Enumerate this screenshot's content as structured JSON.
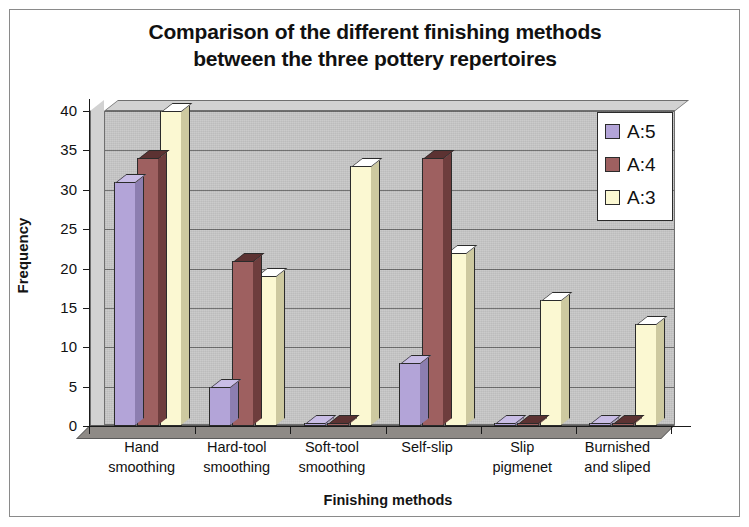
{
  "chart_data": {
    "type": "bar",
    "title": "Comparison of the different finishing methods between the three pottery repertoires",
    "title_lines": [
      "Comparison of the different finishing methods",
      "between the three pottery repertoires"
    ],
    "xlabel": "Finishing methods",
    "ylabel": "Frequency",
    "ylim": [
      0,
      40
    ],
    "yticks": [
      0,
      5,
      10,
      15,
      20,
      25,
      30,
      35,
      40
    ],
    "ytick_labels": [
      "0",
      "5",
      "10",
      "15",
      "20",
      "25",
      "30",
      "35",
      "40"
    ],
    "grid": true,
    "legend_position": "upper right",
    "categories": [
      "Hand smoothing",
      "Hard-tool smoothing",
      "Soft-tool smoothing",
      "Self-slip",
      "Slip pigmenet",
      "Burnished and sliped"
    ],
    "category_lines": [
      [
        "Hand",
        "smoothing"
      ],
      [
        "Hard-tool",
        "smoothing"
      ],
      [
        "Soft-tool",
        "smoothing"
      ],
      [
        "Self-slip",
        ""
      ],
      [
        "Slip",
        "pigmenet"
      ],
      [
        "Burnished",
        "and sliped"
      ]
    ],
    "series": [
      {
        "name": "A:5",
        "color": "#b3a4d8",
        "side_color": "#8c7eb0",
        "cap_color": "#c9bde6",
        "values": [
          31,
          5,
          0,
          8,
          0,
          0
        ]
      },
      {
        "name": "A:4",
        "color": "#9e6060",
        "side_color": "#6e3d3d",
        "cap_color": "#5c3232",
        "values": [
          34,
          21,
          0,
          34,
          0,
          0
        ]
      },
      {
        "name": "A:3",
        "color": "#fbf8d2",
        "side_color": "#cdc9a0",
        "cap_color": "#ffffff",
        "values": [
          40,
          19,
          33,
          22,
          16,
          13
        ]
      }
    ]
  },
  "legend": {
    "entries": [
      {
        "label": "A:5"
      },
      {
        "label": "A:4"
      },
      {
        "label": "A:3"
      }
    ]
  },
  "colors": {
    "plot_background": "#c9c9c9",
    "wall": "#d2d2d2",
    "floor": "#8e8a86",
    "gridline": "#6d6d6d",
    "axis": "#1a1a1a",
    "text": "#111111",
    "frame": "#8a8a8a"
  }
}
